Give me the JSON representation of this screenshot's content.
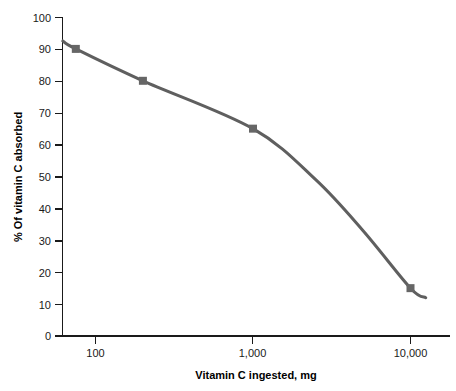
{
  "chart_data": {
    "type": "line",
    "title": "",
    "subtitle": "",
    "xlabel": "Vitamin C ingested, mg",
    "ylabel": "% Of vitamin C absorbed",
    "x_scale": "log",
    "y_scale": "linear",
    "xlim": [
      70,
      13000
    ],
    "ylim": [
      0,
      100
    ],
    "grid": false,
    "legend": "none",
    "x_tick_labels": [
      "100",
      "1,000",
      "10,000"
    ],
    "x_tick_values": [
      100,
      1000,
      10000
    ],
    "y_tick_labels": [
      "0",
      "10",
      "20",
      "30",
      "40",
      "50",
      "60",
      "70",
      "80",
      "90",
      "100"
    ],
    "y_tick_values": [
      0,
      10,
      20,
      30,
      40,
      50,
      60,
      70,
      80,
      90,
      100
    ],
    "series": [
      {
        "name": "% Of vitamin C absorbed",
        "color": "#5f5f5f",
        "marker": "square",
        "marker_color": "#666666",
        "x": [
          75,
          200,
          1000,
          10000
        ],
        "y": [
          90,
          80,
          65,
          15
        ],
        "line_x": [
          62,
          75,
          200,
          1000,
          2500,
          5000,
          10000,
          12500
        ],
        "line_y": [
          92.5,
          90,
          80,
          65,
          49,
          33,
          15,
          12
        ]
      }
    ],
    "annotations": []
  },
  "axes": {
    "x_axis_name": "x-axis",
    "y_axis_name": "y-axis"
  },
  "colors": {
    "background": "#ffffff",
    "axis": "#1a1a1a",
    "text": "#000000",
    "series": "#5f5f5f",
    "marker": "#666666"
  }
}
